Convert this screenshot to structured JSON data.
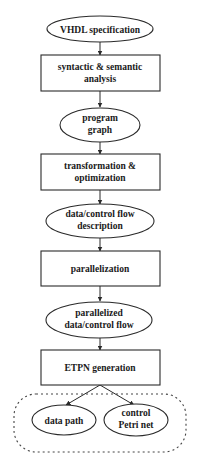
{
  "diagram": {
    "type": "flowchart",
    "nodes": [
      {
        "id": "vhdl",
        "shape": "ellipse",
        "lines": [
          "VHDL specification"
        ]
      },
      {
        "id": "analysis",
        "shape": "box",
        "lines": [
          "syntactic & semantic",
          "analysis"
        ]
      },
      {
        "id": "graph",
        "shape": "ellipse",
        "lines": [
          "program",
          "graph"
        ]
      },
      {
        "id": "transform",
        "shape": "box",
        "lines": [
          "transformation &",
          "optimization"
        ]
      },
      {
        "id": "flow",
        "shape": "ellipse",
        "lines": [
          "data/control flow",
          "description"
        ]
      },
      {
        "id": "parallel",
        "shape": "box",
        "lines": [
          "parallelization"
        ]
      },
      {
        "id": "pflow",
        "shape": "ellipse",
        "lines": [
          "parallelized",
          "data/control flow"
        ]
      },
      {
        "id": "etpn",
        "shape": "box",
        "lines": [
          "ETPN generation"
        ]
      },
      {
        "id": "datapath",
        "shape": "ellipse",
        "lines": [
          "data path"
        ]
      },
      {
        "id": "petri",
        "shape": "ellipse",
        "lines": [
          "control",
          "Petri net"
        ]
      }
    ],
    "edges": [
      [
        "vhdl",
        "analysis"
      ],
      [
        "analysis",
        "graph"
      ],
      [
        "graph",
        "transform"
      ],
      [
        "transform",
        "flow"
      ],
      [
        "flow",
        "parallel"
      ],
      [
        "parallel",
        "pflow"
      ],
      [
        "pflow",
        "etpn"
      ],
      [
        "etpn",
        "datapath"
      ],
      [
        "etpn",
        "petri"
      ]
    ],
    "groups": [
      {
        "id": "etpn-output",
        "style": "dashed-rounded",
        "members": [
          "datapath",
          "petri"
        ]
      }
    ]
  },
  "labels": {
    "vhdl": "VHDL specification",
    "analysis_1": "syntactic & semantic",
    "analysis_2": "analysis",
    "graph_1": "program",
    "graph_2": "graph",
    "transform_1": "transformation &",
    "transform_2": "optimization",
    "flow_1": "data/control flow",
    "flow_2": "description",
    "parallel": "parallelization",
    "pflow_1": "parallelized",
    "pflow_2": "data/control flow",
    "etpn": "ETPN generation",
    "datapath": "data path",
    "petri_1": "control",
    "petri_2": "Petri net"
  },
  "colors": {
    "stroke": "#2a2a2a",
    "background": "#ffffff",
    "text": "#1a1a1a"
  }
}
